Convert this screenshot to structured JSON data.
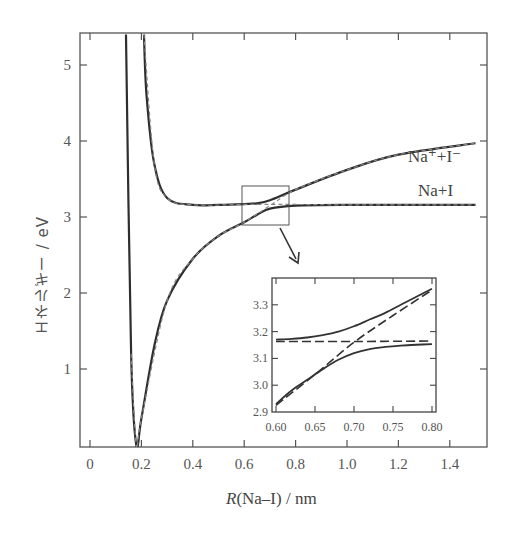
{
  "chart_data": [
    {
      "type": "line",
      "title": "",
      "xlabel": "R(Na–I) / nm",
      "ylabel": "エネルギー / eV",
      "xlim": [
        -0.04,
        1.54
      ],
      "ylim": [
        0,
        5.4
      ],
      "xticks": [
        0,
        0.2,
        0.4,
        0.6,
        0.8,
        1.0,
        1.2,
        1.4
      ],
      "xtick_labels": [
        "0",
        "0.2",
        "0.4",
        "0.6",
        "0.8",
        "1.0",
        "1.2",
        "1.4"
      ],
      "yticks": [
        1,
        2,
        3,
        4,
        5
      ],
      "ytick_labels": [
        "1",
        "2",
        "3",
        "4",
        "5"
      ],
      "grid": false,
      "series": [
        {
          "name": "adiabatic lower (ground) state",
          "style": "solid",
          "x": [
            0.14,
            0.16,
            0.18,
            0.2,
            0.25,
            0.3,
            0.4,
            0.5,
            0.6,
            0.65,
            0.7,
            0.8,
            1.0,
            1.5
          ],
          "y": [
            5.4,
            1.2,
            0.0,
            0.35,
            1.3,
            1.9,
            2.45,
            2.75,
            2.93,
            3.03,
            3.11,
            3.15,
            3.16,
            3.16
          ]
        },
        {
          "name": "adiabatic upper (excited) state",
          "style": "solid",
          "x": [
            0.21,
            0.22,
            0.25,
            0.3,
            0.4,
            0.5,
            0.6,
            0.65,
            0.7,
            0.8,
            1.0,
            1.2,
            1.5
          ],
          "y": [
            5.4,
            4.6,
            3.7,
            3.25,
            3.16,
            3.16,
            3.17,
            3.18,
            3.22,
            3.36,
            3.62,
            3.82,
            3.97
          ]
        },
        {
          "name": "diabatic Na+ + I− (ionic)",
          "style": "dashed",
          "x": [
            0.16,
            0.18,
            0.2,
            0.3,
            0.4,
            0.5,
            0.6,
            0.7,
            0.8,
            1.0,
            1.2,
            1.5
          ],
          "y": [
            1.2,
            0.0,
            0.35,
            1.9,
            2.45,
            2.75,
            2.93,
            3.15,
            3.36,
            3.62,
            3.82,
            3.97
          ]
        },
        {
          "name": "diabatic Na + I (covalent)",
          "style": "dashed",
          "x": [
            0.21,
            0.25,
            0.3,
            0.4,
            0.6,
            0.8,
            1.0,
            1.5
          ],
          "y": [
            5.4,
            3.7,
            3.25,
            3.16,
            3.165,
            3.165,
            3.16,
            3.16
          ]
        }
      ],
      "annotations": [
        {
          "text": "Na⁺+I⁻",
          "x": 1.4,
          "y": 4.2
        },
        {
          "text": "Na+I",
          "x": 1.4,
          "y": 3.4
        },
        {
          "text": "zoom box",
          "x_range": [
            0.595,
            0.77
          ],
          "y_range": [
            2.9,
            3.4
          ]
        }
      ]
    },
    {
      "type": "line",
      "title": "inset (magnified avoided crossing)",
      "xlim": [
        0.595,
        0.8
      ],
      "ylim": [
        2.9,
        3.38
      ],
      "xticks": [
        0.6,
        0.65,
        0.7,
        0.75,
        0.8
      ],
      "xtick_labels": [
        "0.60",
        "0.65",
        "0.70",
        "0.75",
        "0.80"
      ],
      "yticks": [
        2.9,
        3.0,
        3.1,
        3.2,
        3.3
      ],
      "ytick_labels": [
        "2.9",
        "3.0",
        "3.1",
        "3.2",
        "3.3"
      ],
      "grid": false,
      "series": [
        {
          "name": "adiabatic upper",
          "style": "solid",
          "x": [
            0.6,
            0.62,
            0.64,
            0.66,
            0.68,
            0.7,
            0.72,
            0.74,
            0.76,
            0.78,
            0.8
          ],
          "y": [
            3.17,
            3.173,
            3.178,
            3.187,
            3.2,
            3.22,
            3.245,
            3.27,
            3.3,
            3.33,
            3.36
          ]
        },
        {
          "name": "adiabatic lower",
          "style": "solid",
          "x": [
            0.6,
            0.62,
            0.64,
            0.66,
            0.68,
            0.7,
            0.72,
            0.74,
            0.76,
            0.78,
            0.8
          ],
          "y": [
            2.93,
            2.98,
            3.02,
            3.06,
            3.095,
            3.12,
            3.135,
            3.143,
            3.148,
            3.151,
            3.153
          ]
        },
        {
          "name": "diabatic ionic",
          "style": "dashed",
          "x": [
            0.6,
            0.65,
            0.7,
            0.75,
            0.8
          ],
          "y": [
            2.925,
            3.04,
            3.16,
            3.26,
            3.355
          ]
        },
        {
          "name": "diabatic covalent",
          "style": "dashed",
          "x": [
            0.6,
            0.7,
            0.8
          ],
          "y": [
            3.163,
            3.163,
            3.165
          ]
        }
      ]
    }
  ],
  "labels": {
    "x_axis_title_italic": "R",
    "x_axis_title_rest": "(Na–I) / nm",
    "y_axis_title": "エネルギー / eV",
    "ionic_label": "Na⁺+I⁻",
    "covalent_label": "Na+I"
  },
  "main_xticks": [
    {
      "label": "0",
      "v": 0
    },
    {
      "label": "0.2",
      "v": 0.2
    },
    {
      "label": "0.4",
      "v": 0.4
    },
    {
      "label": "0.6",
      "v": 0.6
    },
    {
      "label": "0.8",
      "v": 0.8
    },
    {
      "label": "1.0",
      "v": 1.0
    },
    {
      "label": "1.2",
      "v": 1.2
    },
    {
      "label": "1.4",
      "v": 1.4
    }
  ],
  "main_yticks": [
    {
      "label": "1",
      "v": 1
    },
    {
      "label": "2",
      "v": 2
    },
    {
      "label": "3",
      "v": 3
    },
    {
      "label": "4",
      "v": 4
    },
    {
      "label": "5",
      "v": 5
    }
  ],
  "inset_xticks": [
    {
      "label": "0.60",
      "v": 0.6
    },
    {
      "label": "0.65",
      "v": 0.65
    },
    {
      "label": "0.70",
      "v": 0.7
    },
    {
      "label": "0.75",
      "v": 0.75
    },
    {
      "label": "0.80",
      "v": 0.8
    }
  ],
  "inset_yticks": [
    {
      "label": "2.9",
      "v": 2.9
    },
    {
      "label": "3.0",
      "v": 3.0
    },
    {
      "label": "3.1",
      "v": 3.1
    },
    {
      "label": "3.2",
      "v": 3.2
    },
    {
      "label": "3.3",
      "v": 3.3
    }
  ],
  "colors": {
    "line": "#2e2e2e",
    "frame": "#555555",
    "text": "#555555"
  }
}
